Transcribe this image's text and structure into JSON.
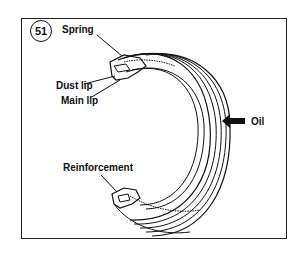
{
  "figure": {
    "number": "51",
    "labels": {
      "spring": "Spring",
      "dust_lip": "Dust lip",
      "main_lip": "Main lip",
      "reinforcement": "Reinforcement",
      "oil": "Oil"
    },
    "colors": {
      "line": "#111111",
      "background": "#ffffff"
    }
  }
}
